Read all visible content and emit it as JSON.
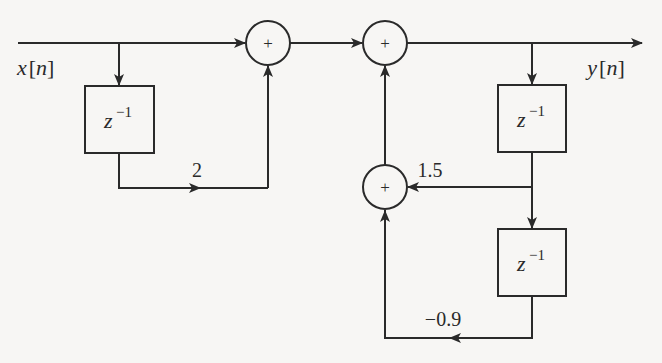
{
  "diagram": {
    "type": "signal-flow block diagram",
    "input": {
      "label_var": "x",
      "label_idx": "n"
    },
    "output": {
      "label_var": "y",
      "label_idx": "n"
    },
    "adders": [
      {
        "id": "adder-1",
        "symbol": "+"
      },
      {
        "id": "adder-2",
        "symbol": "+"
      },
      {
        "id": "adder-3",
        "symbol": "+"
      }
    ],
    "delays": [
      {
        "id": "delay-feedforward",
        "base": "z",
        "exp": "−1"
      },
      {
        "id": "delay-feedback-1",
        "base": "z",
        "exp": "−1"
      },
      {
        "id": "delay-feedback-2",
        "base": "z",
        "exp": "−1"
      }
    ],
    "gains": {
      "feedforward": "2",
      "feedback_1": "1.5",
      "feedback_2": "−0.9"
    },
    "colors": {
      "ink": "#2a2a2a",
      "background": "#f7f6f4"
    }
  }
}
